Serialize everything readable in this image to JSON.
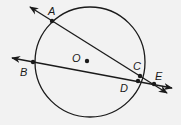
{
  "diagram": {
    "type": "geometry-circle-secants",
    "circle": {
      "center_label": "O",
      "cx": 90,
      "cy": 62,
      "r": 55
    },
    "points": {
      "A": {
        "label": "A",
        "x": 52,
        "y": 21
      },
      "B": {
        "label": "B",
        "x": 33,
        "y": 62
      },
      "C": {
        "label": "C",
        "x": 140,
        "y": 77
      },
      "D": {
        "label": "D",
        "x": 138,
        "y": 81
      },
      "E": {
        "label": "E",
        "x": 154,
        "y": 84
      },
      "O": {
        "label": "O",
        "x": 87,
        "y": 61
      }
    },
    "lines": [
      {
        "name": "secant-AC-E",
        "through": [
          "A",
          "C",
          "E"
        ]
      },
      {
        "name": "secant-BD-E",
        "through": [
          "B",
          "D",
          "E"
        ]
      }
    ],
    "colors": {
      "stroke": "#1a1a1a",
      "background": "#f2f2f2"
    }
  }
}
